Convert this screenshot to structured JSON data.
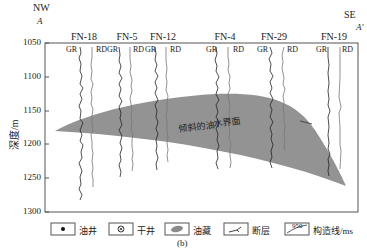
{
  "figure": {
    "direction_left": "NW",
    "direction_left_label": "A",
    "direction_right": "SE",
    "direction_right_label": "A'",
    "ylabel": "深度/m",
    "yticks": [
      "1050",
      "1100",
      "1150",
      "1200",
      "1250",
      "1300"
    ],
    "wells": [
      {
        "name": "FN-18",
        "x": 83
      },
      {
        "name": "FN-5",
        "x": 123
      },
      {
        "name": "FN-12",
        "x": 159
      },
      {
        "name": "FN-4",
        "x": 219
      },
      {
        "name": "FN-29",
        "x": 273
      },
      {
        "name": "FN-19",
        "x": 330
      }
    ],
    "curve_labels": {
      "gr": "GR",
      "rd": "RD"
    },
    "oil_water_label": "倾斜的油水界面",
    "caption": "(b)"
  },
  "legend": [
    {
      "symbol": "oil-well",
      "label": "油井"
    },
    {
      "symbol": "dry-well",
      "label": "干井"
    },
    {
      "symbol": "reservoir",
      "label": "油藏"
    },
    {
      "symbol": "fault",
      "label": "断层"
    },
    {
      "symbol": "contour",
      "value": "950",
      "label": "构造线/ms"
    }
  ],
  "colors": {
    "oil": "#8a8a8a",
    "frame": "#555555",
    "log_dark": "#222222",
    "log_light": "#777777"
  }
}
